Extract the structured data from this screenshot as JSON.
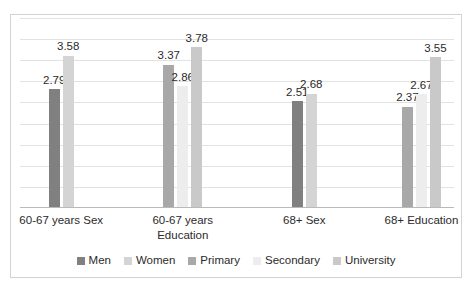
{
  "chart_data": {
    "type": "bar",
    "title": "",
    "subtitle": "",
    "xlabel": "",
    "ylabel": "",
    "ylim": [
      0,
      4.5
    ],
    "grid": true,
    "grid_count": 9,
    "legend_position": "bottom",
    "categories": [
      "60-67 years Sex",
      "60-67 years Education",
      "68+ Sex",
      "68+ Education"
    ],
    "legend": [
      "Men",
      "Women",
      "Primary",
      "Secondary",
      "University"
    ],
    "colors": {
      "Men": "#808080",
      "Women": "#d4d4d4",
      "Primary": "#a8a8a8",
      "Secondary": "#ededed",
      "University": "#c9c9c9"
    },
    "groups": [
      {
        "category": "60-67 years Sex",
        "bars": [
          {
            "series": "Men",
            "value": 2.79,
            "label": "2.79",
            "color": "#808080"
          },
          {
            "series": "Women",
            "value": 3.58,
            "label": "3.58",
            "color": "#d4d4d4"
          }
        ]
      },
      {
        "category": "60-67 years Education",
        "bars": [
          {
            "series": "Primary",
            "value": 3.37,
            "label": "3.37",
            "color": "#a8a8a8"
          },
          {
            "series": "Secondary",
            "value": 2.86,
            "label": "2.86",
            "color": "#ededed"
          },
          {
            "series": "University",
            "value": 3.78,
            "label": "3.78",
            "color": "#c9c9c9"
          }
        ]
      },
      {
        "category": "68+ Sex",
        "bars": [
          {
            "series": "Men",
            "value": 2.51,
            "label": "2.51",
            "color": "#808080"
          },
          {
            "series": "Women",
            "value": 2.68,
            "label": "2.68",
            "color": "#d4d4d4"
          }
        ]
      },
      {
        "category": "68+ Education",
        "bars": [
          {
            "series": "Primary",
            "value": 2.37,
            "label": "2.37",
            "color": "#a8a8a8"
          },
          {
            "series": "Secondary",
            "value": 2.67,
            "label": "2.67",
            "color": "#ededed"
          },
          {
            "series": "University",
            "value": 3.55,
            "label": "3.55",
            "color": "#c9c9c9"
          }
        ]
      }
    ]
  },
  "axis": {
    "category_labels": [
      {
        "line1": "60-67 years Sex",
        "line2": ""
      },
      {
        "line1": "60-67 years",
        "line2": "Education"
      },
      {
        "line1": "68+ Sex",
        "line2": ""
      },
      {
        "line1": "68+ Education",
        "line2": ""
      }
    ]
  },
  "legend": {
    "items": [
      {
        "label": "Men",
        "color": "#808080"
      },
      {
        "label": "Women",
        "color": "#d4d4d4"
      },
      {
        "label": "Primary",
        "color": "#a8a8a8"
      },
      {
        "label": "Secondary",
        "color": "#ededed"
      },
      {
        "label": "University",
        "color": "#c9c9c9"
      }
    ]
  },
  "caption": {
    "text": ""
  }
}
